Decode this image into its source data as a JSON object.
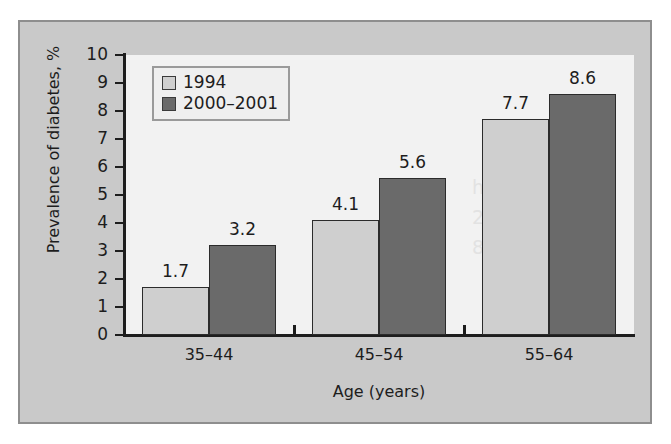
{
  "chart_data": {
    "type": "bar",
    "title": "",
    "xlabel": "Age (years)",
    "ylabel": "Prevalence of diabetes, %",
    "categories": [
      "35–44",
      "45–54",
      "55–64"
    ],
    "series": [
      {
        "name": "1994",
        "values": [
          1.7,
          3.2,
          7.7
        ],
        "color": "#cfcfcf"
      },
      {
        "name": "2000–2001",
        "values": [
          3.2,
          5.6,
          8.6
        ],
        "color": "#6a6a6a"
      }
    ],
    "plotted_series": [
      {
        "name": "1994",
        "values": [
          1.7,
          4.1,
          7.7
        ],
        "color": "#cfcfcf"
      },
      {
        "name": "2000–2001",
        "values": [
          3.2,
          5.6,
          8.6
        ],
        "color": "#6a6a6a"
      }
    ],
    "value_labels": [
      [
        "1.7",
        "4.1",
        "7.7"
      ],
      [
        "3.2",
        "5.6",
        "8.6"
      ]
    ],
    "ylim": [
      0,
      10
    ],
    "y_ticks": [
      "0",
      "1",
      "2",
      "3",
      "4",
      "5",
      "6",
      "7",
      "8",
      "9",
      "10"
    ],
    "grid": false,
    "legend_position": "top-left"
  },
  "axes": {
    "y_title": "Prevalence of diabetes, %",
    "x_title": "Age (years)"
  },
  "legend": {
    "entries": [
      {
        "label": "1994",
        "color": "#cfcfcf"
      },
      {
        "label": "2000–2001",
        "color": "#6a6a6a"
      }
    ]
  },
  "colors": {
    "figure_background": "#c9c9c9",
    "plot_background": "#f2f2f2",
    "axis": "#1d1d1d",
    "series_a": "#cfcfcf",
    "series_b": "#6a6a6a",
    "frame_border": "#8e8e8e"
  },
  "artifact": {
    "line1": "h",
    "line2": "2",
    "line3": "8"
  }
}
